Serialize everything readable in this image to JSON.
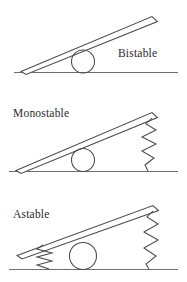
{
  "figure": {
    "width": 187,
    "height": 282,
    "background_color": "#ffffff",
    "line_color": "#4a4a4a",
    "ground_color": "#6e6e6e",
    "text_color": "#2b2b2b"
  },
  "panels": [
    {
      "id": "bistable",
      "label": "Bistable",
      "label_position": "right",
      "springs": 0,
      "spring_labels": [],
      "elements": [
        "beam",
        "ball",
        "ground"
      ],
      "beam_tilt": "up-right",
      "ball_radius": 11
    },
    {
      "id": "monostable",
      "label": "Monostable",
      "label_position": "left",
      "springs": 1,
      "spring_labels": [
        "right-spring"
      ],
      "elements": [
        "beam",
        "ball",
        "ground",
        "right-spring"
      ],
      "beam_tilt": "up-right",
      "ball_radius": 11
    },
    {
      "id": "astable",
      "label": "Astable",
      "label_position": "left",
      "springs": 2,
      "spring_labels": [
        "left-spring",
        "right-spring"
      ],
      "elements": [
        "beam",
        "ball",
        "ground",
        "left-spring",
        "right-spring"
      ],
      "beam_tilt": "up-right",
      "ball_radius": 13
    }
  ],
  "icons": {
    "beam": "tilted-bar-icon",
    "ball": "circle-roller-icon",
    "spring": "zigzag-spring-icon",
    "ground": "ground-line-icon"
  }
}
